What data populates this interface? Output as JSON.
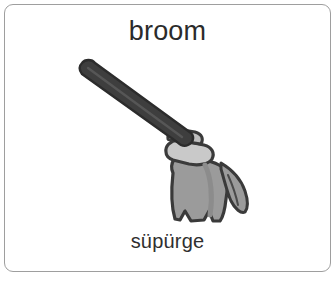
{
  "card": {
    "type": "vocabulary-flashcard",
    "border_color": "#9e9e9e",
    "background_color": "#ffffff"
  },
  "word_en": "broom",
  "word_tr": "süpürge",
  "text_color": "#2b2b2b",
  "illustration": {
    "name": "broom-illustration",
    "subject": "broom",
    "style": "grayscale clip art",
    "parts": {
      "handle": "broom-handle",
      "collar": "broom-collar",
      "head": "broom-bristle-head",
      "tuft": "broom-side-tuft"
    },
    "colors": {
      "handle": "#3e3e3e",
      "handle_shadow": "#2c2c2c",
      "collar": "#c9c9c9",
      "head": "#9b9b9b",
      "head_shade": "#8c8c8c",
      "outline": "#3a3a3a"
    }
  }
}
